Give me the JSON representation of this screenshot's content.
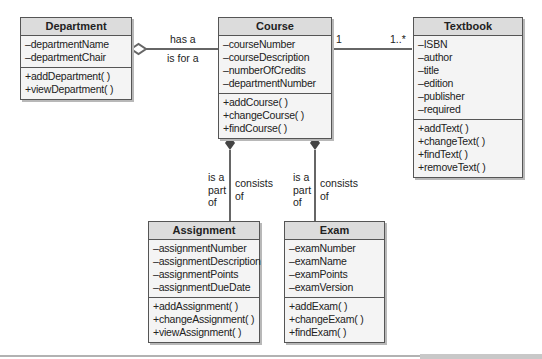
{
  "diagram": {
    "type": "UML class diagram",
    "classes": {
      "department": {
        "name": "Department",
        "attributes": [
          "–departmentName",
          "–departmentChair"
        ],
        "operations": [
          "+addDepartment( )",
          "+viewDepartment( )"
        ]
      },
      "course": {
        "name": "Course",
        "attributes": [
          "–courseNumber",
          "–courseDescription",
          "–numberOfCredits",
          "–departmentNumber"
        ],
        "operations": [
          "+addCourse( )",
          "+changeCourse( )",
          "+findCourse( )"
        ]
      },
      "textbook": {
        "name": "Textbook",
        "attributes": [
          "–ISBN",
          "–author",
          "–title",
          "–edition",
          "–publisher",
          "–required"
        ],
        "operations": [
          "+addText( )",
          "+changeText( )",
          "+findText( )",
          "+removeText( )"
        ]
      },
      "assignment": {
        "name": "Assignment",
        "attributes": [
          "–assignmentNumber",
          "–assignmentDescription",
          "–assignmentPoints",
          "–assignmentDueDate"
        ],
        "operations": [
          "+addAssignment( )",
          "+changeAssignment( )",
          "+viewAssignment( )"
        ]
      },
      "exam": {
        "name": "Exam",
        "attributes": [
          "–examNumber",
          "–examName",
          "–examPoints",
          "–examVersion"
        ],
        "operations": [
          "+addExam( )",
          "+changeExam( )",
          "+findExam( )"
        ]
      }
    },
    "associations": {
      "dept_course": {
        "type": "aggregation",
        "label_top": "has a",
        "label_bottom": "is for a"
      },
      "course_textbook": {
        "type": "association",
        "mult_course": "1",
        "mult_textbook": "1..*"
      },
      "course_assignment": {
        "type": "composition",
        "label_left": [
          "is a",
          "part",
          "of"
        ],
        "label_right": [
          "consists",
          "of"
        ]
      },
      "course_exam": {
        "type": "composition",
        "label_left": [
          "is a",
          "part",
          "of"
        ],
        "label_right": [
          "consists",
          "of"
        ]
      }
    },
    "colors": {
      "header": "#dcdcdc",
      "body": "#f4f4f4",
      "border": "#555555",
      "line": "#555555"
    }
  }
}
